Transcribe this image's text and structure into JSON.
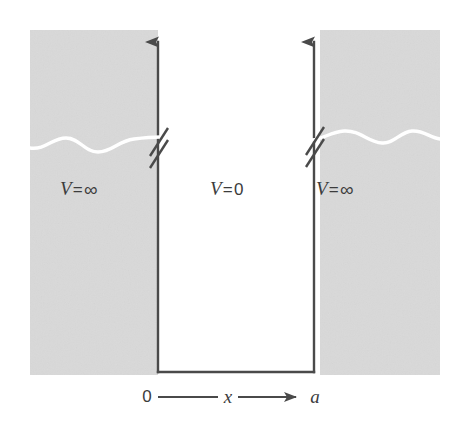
{
  "figure": {
    "kind": "infinite-square-well-potential-diagram",
    "width": 462,
    "height": 436,
    "background_color": "#ffffff",
    "shaded_region_color": "#d9d9d9",
    "line_color": "#4a4a4a",
    "wave_color": "#ffffff",
    "text_color": "#3c3c3c"
  },
  "labels": {
    "left_region": {
      "symbol": "V",
      "equals": "=",
      "value": "∞",
      "full": "V=∞"
    },
    "center_region": {
      "symbol": "V",
      "equals": "=",
      "value": "0",
      "full": "V=0"
    },
    "right_region": {
      "symbol": "V",
      "equals": "=",
      "value": "∞",
      "full": "V=∞"
    }
  },
  "axis": {
    "origin_label": "0",
    "variable_label": "x",
    "end_label": "a",
    "full": "0 — x → a",
    "direction": "left-to-right",
    "arrowhead": "right"
  },
  "geometry": {
    "well_left_x": 158,
    "well_right_x": 314,
    "well_bottom_y": 372,
    "axis_top_y": 30,
    "shaded_left": {
      "x": 30,
      "y": 30,
      "width": 128,
      "height": 345
    },
    "shaded_right": {
      "x": 320,
      "y": 30,
      "width": 120,
      "height": 345
    },
    "break_mark_y": 138,
    "wave_y": 140
  },
  "annotations": {
    "axis_break_marks": 2,
    "wavy_lines": 2,
    "vertical_arrows": 2
  }
}
